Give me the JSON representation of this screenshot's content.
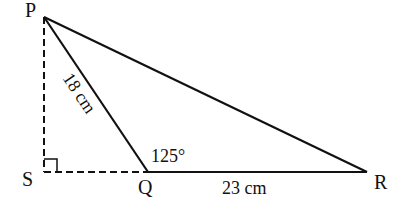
{
  "diagram": {
    "type": "triangle-geometry",
    "points": {
      "P": {
        "label": "P"
      },
      "Q": {
        "label": "Q"
      },
      "R": {
        "label": "R"
      },
      "S": {
        "label": "S"
      }
    },
    "labels": {
      "PQ_length": "18 cm",
      "QR_length": "23 cm",
      "angle_PQR": "125°"
    },
    "segments": [
      {
        "from": "P",
        "to": "Q",
        "style": "solid"
      },
      {
        "from": "Q",
        "to": "R",
        "style": "solid"
      },
      {
        "from": "P",
        "to": "R",
        "style": "solid"
      },
      {
        "from": "P",
        "to": "S",
        "style": "dashed"
      },
      {
        "from": "S",
        "to": "Q",
        "style": "dashed"
      }
    ],
    "right_angle_at": "S",
    "colors": {
      "line": "#111111",
      "background": "#ffffff"
    }
  }
}
